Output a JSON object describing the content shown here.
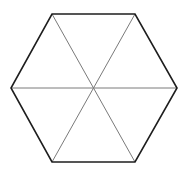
{
  "diagram": {
    "width": 188,
    "height": 173,
    "background": "#ffffff",
    "center": [
      94,
      88
    ],
    "vertices": [
      [
        52,
        14
      ],
      [
        135,
        14
      ],
      [
        177,
        88
      ],
      [
        135,
        162
      ],
      [
        52,
        162
      ],
      [
        11,
        88
      ]
    ],
    "outline": {
      "color": "#1e1e1e",
      "width": 1.6
    },
    "diagonals": {
      "color": "#7a7a7a",
      "width": 1,
      "segments": [
        {
          "from": 0,
          "to": 3
        },
        {
          "from": 1,
          "to": 4
        },
        {
          "from": 5,
          "to": 2
        }
      ]
    }
  }
}
